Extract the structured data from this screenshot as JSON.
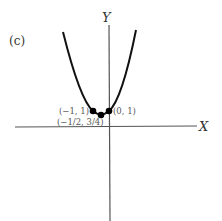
{
  "panel_label": "(c)",
  "axes": {
    "x_label": "X",
    "y_label": "Y"
  },
  "points": [
    {
      "label": "(−1, 1)",
      "x": -1,
      "y": 1
    },
    {
      "label": "(0, 1)",
      "x": 0,
      "y": 1
    },
    {
      "label": "(−1/2, 3/4)",
      "x": -0.5,
      "y": 0.75
    }
  ],
  "curve": {
    "type": "parabola",
    "equation": "y = x^2 + x + 1",
    "vertex": [
      -0.5,
      0.75
    ]
  },
  "colors": {
    "curve": "#111111",
    "axes": "#444444",
    "points": "#000000"
  }
}
